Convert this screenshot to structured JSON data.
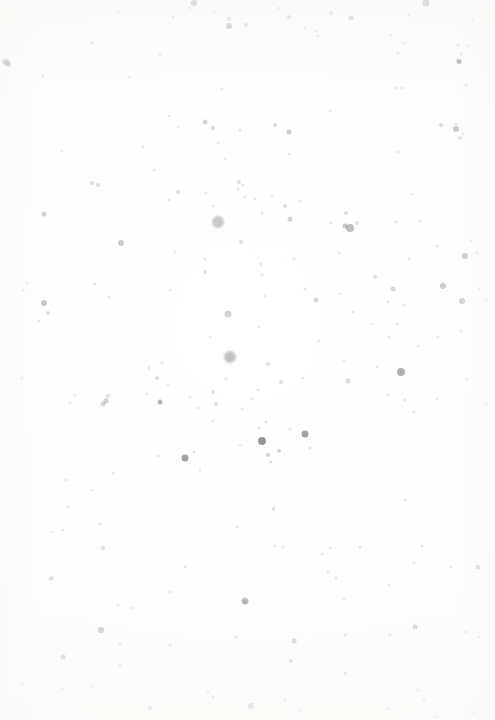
{
  "image": {
    "kind": "speckle-texture",
    "title": "Scattered grey speckle field on near-white paper",
    "width": 495,
    "height": 720,
    "background_color": "#fdfdfd",
    "speck_color": "#6b6b6f",
    "has_text": false,
    "has_border": false,
    "description": "A high-key scanned paper surface covered in randomly scattered grey dots of varying size and opacity. Density peaks through the upper-middle band; the darkest, most saturated dots form a small cluster near the horizontal centre at roughly two-thirds height. Lower third is sparse and pale."
  },
  "chart_data": {
    "type": "scatter",
    "subtitle": "",
    "xlabel": "",
    "ylabel": "",
    "xlim": [
      0,
      495
    ],
    "ylim": [
      0,
      720
    ],
    "grid": false,
    "legend": null,
    "axes_visible": false,
    "point_color": "#6b6b6f",
    "background_color": "#fdfdfd",
    "point_fields": [
      "x",
      "y",
      "d",
      "a"
    ],
    "points": [
      [
        5,
        62,
        6,
        0.34
      ],
      [
        118,
        12,
        3,
        0.16
      ],
      [
        173,
        17,
        3,
        0.18
      ],
      [
        190,
        8,
        3,
        0.14
      ],
      [
        194,
        3,
        6,
        0.42
      ],
      [
        229,
        19,
        4,
        0.24
      ],
      [
        214,
        12,
        3,
        0.15
      ],
      [
        279,
        8,
        3,
        0.17
      ],
      [
        289,
        17,
        4,
        0.22
      ],
      [
        305,
        28,
        3,
        0.15
      ],
      [
        316,
        31,
        3,
        0.13
      ],
      [
        331,
        13,
        4,
        0.22
      ],
      [
        351,
        18,
        5,
        0.3
      ],
      [
        426,
        3,
        7,
        0.42
      ],
      [
        409,
        15,
        3,
        0.16
      ],
      [
        458,
        45,
        3,
        0.16
      ],
      [
        473,
        21,
        3,
        0.14
      ],
      [
        229,
        26,
        6,
        0.38
      ],
      [
        246,
        25,
        4,
        0.2
      ],
      [
        92,
        43,
        3,
        0.15
      ],
      [
        8,
        64,
        6,
        0.35
      ],
      [
        160,
        55,
        3,
        0.12
      ],
      [
        318,
        36,
        3,
        0.18
      ],
      [
        457,
        60,
        3,
        0.14
      ],
      [
        461,
        54,
        3,
        0.13
      ],
      [
        468,
        46,
        3,
        0.15
      ],
      [
        43,
        76,
        3,
        0.12
      ],
      [
        129,
        77,
        3,
        0.11
      ],
      [
        222,
        89,
        3,
        0.16
      ],
      [
        398,
        53,
        3,
        0.16
      ],
      [
        402,
        88,
        3,
        0.15
      ],
      [
        460,
        62,
        3,
        0.22
      ],
      [
        404,
        43,
        3,
        0.12
      ],
      [
        391,
        35,
        3,
        0.13
      ],
      [
        6,
        62,
        6,
        0.34
      ],
      [
        169,
        116,
        3,
        0.14
      ],
      [
        205,
        122,
        5,
        0.28
      ],
      [
        213,
        128,
        4,
        0.22
      ],
      [
        240,
        130,
        3,
        0.16
      ],
      [
        178,
        127,
        3,
        0.13
      ],
      [
        275,
        125,
        4,
        0.22
      ],
      [
        289,
        132,
        5,
        0.32
      ],
      [
        330,
        111,
        3,
        0.15
      ],
      [
        441,
        125,
        4,
        0.22
      ],
      [
        456,
        124,
        3,
        0.18
      ],
      [
        463,
        134,
        3,
        0.14
      ],
      [
        459,
        62,
        5,
        0.28
      ],
      [
        466,
        85,
        3,
        0.13
      ],
      [
        396,
        88,
        3,
        0.14
      ],
      [
        8,
        63,
        5,
        0.3
      ],
      [
        62,
        151,
        3,
        0.12
      ],
      [
        143,
        147,
        3,
        0.16
      ],
      [
        218,
        143,
        3,
        0.14
      ],
      [
        98,
        185,
        4,
        0.22
      ],
      [
        154,
        170,
        3,
        0.15
      ],
      [
        178,
        192,
        4,
        0.2
      ],
      [
        238,
        189,
        3,
        0.16
      ],
      [
        459,
        61,
        5,
        0.28
      ],
      [
        398,
        152,
        3,
        0.14
      ],
      [
        460,
        138,
        4,
        0.2
      ],
      [
        456,
        129,
        6,
        0.34
      ],
      [
        225,
        159,
        3,
        0.13
      ],
      [
        289,
        154,
        3,
        0.14
      ],
      [
        44,
        214,
        5,
        0.28
      ],
      [
        92,
        183,
        4,
        0.22
      ],
      [
        169,
        200,
        3,
        0.15
      ],
      [
        206,
        193,
        3,
        0.13
      ],
      [
        218,
        222,
        12,
        0.36
      ],
      [
        213,
        206,
        3,
        0.12
      ],
      [
        245,
        197,
        3,
        0.13
      ],
      [
        239,
        182,
        4,
        0.22
      ],
      [
        243,
        185,
        3,
        0.14
      ],
      [
        255,
        199,
        3,
        0.14
      ],
      [
        262,
        213,
        3,
        0.15
      ],
      [
        272,
        196,
        3,
        0.13
      ],
      [
        285,
        206,
        4,
        0.22
      ],
      [
        290,
        219,
        5,
        0.3
      ],
      [
        300,
        201,
        3,
        0.13
      ],
      [
        331,
        223,
        3,
        0.14
      ],
      [
        345,
        226,
        5,
        0.34
      ],
      [
        350,
        228,
        8,
        0.42
      ],
      [
        357,
        223,
        4,
        0.22
      ],
      [
        346,
        213,
        4,
        0.22
      ],
      [
        396,
        222,
        3,
        0.15
      ],
      [
        420,
        221,
        3,
        0.12
      ],
      [
        437,
        246,
        3,
        0.16
      ],
      [
        471,
        241,
        3,
        0.15
      ],
      [
        412,
        194,
        3,
        0.12
      ],
      [
        175,
        252,
        3,
        0.12
      ],
      [
        121,
        243,
        6,
        0.34
      ],
      [
        205,
        259,
        3,
        0.14
      ],
      [
        241,
        242,
        4,
        0.22
      ],
      [
        261,
        264,
        3,
        0.14
      ],
      [
        294,
        259,
        3,
        0.14
      ],
      [
        339,
        253,
        3,
        0.13
      ],
      [
        409,
        259,
        3,
        0.15
      ],
      [
        465,
        256,
        6,
        0.36
      ],
      [
        477,
        253,
        3,
        0.15
      ],
      [
        44,
        303,
        6,
        0.36
      ],
      [
        48,
        313,
        4,
        0.2
      ],
      [
        27,
        283,
        3,
        0.13
      ],
      [
        39,
        321,
        3,
        0.14
      ],
      [
        23,
        290,
        3,
        0.13
      ],
      [
        95,
        284,
        3,
        0.15
      ],
      [
        109,
        297,
        3,
        0.13
      ],
      [
        205,
        272,
        4,
        0.22
      ],
      [
        170,
        290,
        3,
        0.14
      ],
      [
        228,
        314,
        7,
        0.3
      ],
      [
        262,
        275,
        3,
        0.15
      ],
      [
        265,
        296,
        3,
        0.13
      ],
      [
        316,
        300,
        5,
        0.26
      ],
      [
        305,
        289,
        3,
        0.14
      ],
      [
        340,
        294,
        3,
        0.13
      ],
      [
        353,
        312,
        3,
        0.14
      ],
      [
        375,
        277,
        4,
        0.22
      ],
      [
        393,
        289,
        5,
        0.26
      ],
      [
        388,
        302,
        3,
        0.15
      ],
      [
        397,
        324,
        3,
        0.14
      ],
      [
        372,
        324,
        3,
        0.13
      ],
      [
        389,
        337,
        3,
        0.13
      ],
      [
        404,
        305,
        3,
        0.14
      ],
      [
        443,
        286,
        6,
        0.34
      ],
      [
        461,
        331,
        3,
        0.14
      ],
      [
        418,
        346,
        3,
        0.14
      ],
      [
        438,
        337,
        3,
        0.14
      ],
      [
        462,
        301,
        6,
        0.32
      ],
      [
        486,
        300,
        3,
        0.14
      ],
      [
        479,
        289,
        3,
        0.13
      ],
      [
        149,
        368,
        3,
        0.14
      ],
      [
        157,
        378,
        4,
        0.2
      ],
      [
        162,
        363,
        3,
        0.14
      ],
      [
        230,
        357,
        12,
        0.4
      ],
      [
        210,
        337,
        3,
        0.13
      ],
      [
        268,
        364,
        4,
        0.22
      ],
      [
        281,
        382,
        4,
        0.2
      ],
      [
        259,
        327,
        3,
        0.13
      ],
      [
        303,
        378,
        3,
        0.16
      ],
      [
        319,
        341,
        3,
        0.14
      ],
      [
        344,
        361,
        3,
        0.13
      ],
      [
        348,
        381,
        5,
        0.22
      ],
      [
        377,
        367,
        3,
        0.14
      ],
      [
        401,
        372,
        8,
        0.52
      ],
      [
        405,
        400,
        3,
        0.14
      ],
      [
        388,
        395,
        3,
        0.14
      ],
      [
        414,
        412,
        3,
        0.14
      ],
      [
        437,
        399,
        3,
        0.13
      ],
      [
        467,
        379,
        3,
        0.13
      ],
      [
        486,
        404,
        3,
        0.15
      ],
      [
        22,
        378,
        3,
        0.13
      ],
      [
        70,
        403,
        3,
        0.13
      ],
      [
        103,
        404,
        5,
        0.26
      ],
      [
        75,
        395,
        3,
        0.12
      ],
      [
        147,
        394,
        3,
        0.14
      ],
      [
        168,
        385,
        3,
        0.13
      ],
      [
        190,
        397,
        3,
        0.13
      ],
      [
        198,
        408,
        3,
        0.13
      ],
      [
        213,
        392,
        4,
        0.22
      ],
      [
        216,
        404,
        4,
        0.2
      ],
      [
        226,
        379,
        3,
        0.14
      ],
      [
        242,
        409,
        3,
        0.14
      ],
      [
        252,
        399,
        3,
        0.14
      ],
      [
        258,
        390,
        3,
        0.14
      ],
      [
        213,
        421,
        3,
        0.13
      ],
      [
        160,
        402,
        5,
        0.48
      ],
      [
        106,
        401,
        5,
        0.3
      ],
      [
        108,
        396,
        4,
        0.2
      ],
      [
        185,
        458,
        7,
        0.62
      ],
      [
        158,
        456,
        3,
        0.16
      ],
      [
        194,
        452,
        3,
        0.18
      ],
      [
        200,
        470,
        3,
        0.14
      ],
      [
        262,
        441,
        8,
        0.7
      ],
      [
        259,
        428,
        3,
        0.22
      ],
      [
        266,
        422,
        3,
        0.16
      ],
      [
        268,
        455,
        4,
        0.3
      ],
      [
        279,
        451,
        4,
        0.26
      ],
      [
        271,
        462,
        3,
        0.22
      ],
      [
        305,
        434,
        7,
        0.62
      ],
      [
        310,
        448,
        3,
        0.18
      ],
      [
        290,
        429,
        3,
        0.14
      ],
      [
        240,
        445,
        3,
        0.13
      ],
      [
        113,
        473,
        3,
        0.13
      ],
      [
        92,
        490,
        3,
        0.14
      ],
      [
        66,
        480,
        3,
        0.13
      ],
      [
        273,
        509,
        3,
        0.16
      ],
      [
        275,
        546,
        3,
        0.13
      ],
      [
        63,
        530,
        3,
        0.15
      ],
      [
        50,
        579,
        3,
        0.14
      ],
      [
        52,
        578,
        4,
        0.18
      ],
      [
        103,
        548,
        4,
        0.2
      ],
      [
        100,
        524,
        3,
        0.14
      ],
      [
        52,
        532,
        3,
        0.13
      ],
      [
        68,
        507,
        3,
        0.12
      ],
      [
        118,
        605,
        3,
        0.13
      ],
      [
        131,
        608,
        3,
        0.13
      ],
      [
        283,
        547,
        3,
        0.13
      ],
      [
        170,
        592,
        3,
        0.14
      ],
      [
        185,
        567,
        3,
        0.15
      ],
      [
        245,
        601,
        7,
        0.38
      ],
      [
        237,
        527,
        3,
        0.16
      ],
      [
        245,
        602,
        5,
        0.22
      ],
      [
        322,
        554,
        3,
        0.15
      ],
      [
        330,
        548,
        3,
        0.14
      ],
      [
        328,
        572,
        3,
        0.13
      ],
      [
        336,
        578,
        3,
        0.14
      ],
      [
        360,
        547,
        3,
        0.14
      ],
      [
        344,
        599,
        3,
        0.14
      ],
      [
        389,
        585,
        3,
        0.13
      ],
      [
        414,
        563,
        3,
        0.13
      ],
      [
        422,
        546,
        3,
        0.15
      ],
      [
        451,
        567,
        3,
        0.13
      ],
      [
        478,
        567,
        5,
        0.26
      ],
      [
        405,
        500,
        3,
        0.16
      ],
      [
        274,
        508,
        3,
        0.16
      ],
      [
        101,
        630,
        6,
        0.32
      ],
      [
        120,
        644,
        3,
        0.14
      ],
      [
        236,
        637,
        3,
        0.15
      ],
      [
        294,
        641,
        5,
        0.26
      ],
      [
        345,
        635,
        3,
        0.15
      ],
      [
        390,
        635,
        3,
        0.14
      ],
      [
        415,
        627,
        5,
        0.26
      ],
      [
        466,
        632,
        3,
        0.14
      ],
      [
        479,
        637,
        3,
        0.13
      ],
      [
        63,
        657,
        5,
        0.24
      ],
      [
        170,
        645,
        3,
        0.14
      ],
      [
        291,
        661,
        4,
        0.2
      ],
      [
        345,
        673,
        3,
        0.13
      ],
      [
        120,
        665,
        3,
        0.13
      ],
      [
        213,
        697,
        3,
        0.15
      ],
      [
        251,
        706,
        6,
        0.26
      ],
      [
        345,
        674,
        3,
        0.14
      ],
      [
        418,
        690,
        3,
        0.13
      ],
      [
        424,
        700,
        3,
        0.15
      ],
      [
        62,
        689,
        3,
        0.13
      ],
      [
        150,
        708,
        4,
        0.2
      ],
      [
        208,
        692,
        3,
        0.13
      ],
      [
        285,
        700,
        3,
        0.14
      ],
      [
        301,
        711,
        3,
        0.12
      ],
      [
        388,
        709,
        3,
        0.13
      ],
      [
        474,
        713,
        3,
        0.13
      ],
      [
        22,
        684,
        3,
        0.12
      ],
      [
        92,
        686,
        3,
        0.12
      ],
      [
        437,
        717,
        3,
        0.12
      ]
    ]
  }
}
